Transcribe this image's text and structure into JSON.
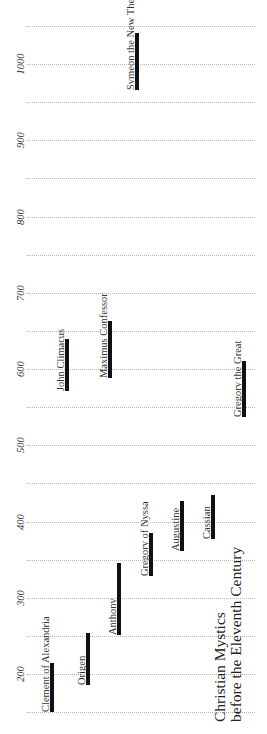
{
  "chart_data": {
    "type": "bar",
    "orientation": "vertical-timeline (rotated, years increase upward)",
    "title_lines": [
      "Christian Mystics",
      "before the Eleventh Century"
    ],
    "xlabel": "",
    "ylabel": "",
    "ylim": [
      150,
      1050
    ],
    "grid": true,
    "grid_step": 50,
    "tick_labels": [
      "200",
      "300",
      "400",
      "500",
      "600",
      "700",
      "800",
      "900",
      "1000"
    ],
    "ticks": [
      200,
      300,
      400,
      500,
      600,
      700,
      800,
      900,
      1000
    ],
    "gridlines": [
      150,
      200,
      250,
      300,
      350,
      400,
      450,
      500,
      550,
      600,
      650,
      700,
      750,
      800,
      850,
      900,
      950,
      1000,
      1050
    ],
    "series": [
      {
        "name": "Clement of Alexandria",
        "start": 150,
        "end": 215,
        "x": 52
      },
      {
        "name": "Origen",
        "start": 185,
        "end": 254,
        "x": 88
      },
      {
        "name": "Anthony",
        "start": 251,
        "end": 345,
        "x": 119
      },
      {
        "name": "Gregory of Nyssa",
        "start": 328,
        "end": 385,
        "x": 151
      },
      {
        "name": "Augustine",
        "start": 361,
        "end": 427,
        "x": 182
      },
      {
        "name": "Cassian",
        "start": 377,
        "end": 435,
        "x": 213
      },
      {
        "name": "Gregory the Great",
        "start": 537,
        "end": 610,
        "x": 244
      },
      {
        "name": "John Climacus",
        "start": 571,
        "end": 639,
        "x": 67
      },
      {
        "name": "Maximus Confessor",
        "start": 588,
        "end": 663,
        "x": 110
      },
      {
        "name": "Symeon the New Theologian",
        "start": 966,
        "end": 1041,
        "x": 137
      }
    ]
  },
  "layout": {
    "y_ref_year": 1000,
    "y_ref_px": 64,
    "px_per_year": 0.7625,
    "grid_x_start": 27,
    "grid_x_end": 255,
    "tick_x": 20,
    "label_offset": 11,
    "title_x": [
      214,
      230
    ],
    "title_bottom_y": 722
  },
  "colors": {
    "bar": "#111111",
    "grid": "#b8b8b8",
    "text": "#333333",
    "background": "#ffffff"
  }
}
